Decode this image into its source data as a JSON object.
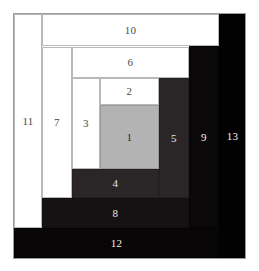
{
  "diagram": {
    "canvas": {
      "width": 259,
      "height": 271,
      "background": "#ffffff"
    },
    "palette": {
      "white": "#ffffff",
      "gray": "#b3b3b3",
      "dark": "#2a2527",
      "darker": "#161214",
      "black": "#070506",
      "outline": "#9b9b9b",
      "label_light": "#f0f0f0",
      "label_dark": "#4a4a4a"
    },
    "regions": [
      {
        "id": 1,
        "label": "1",
        "tone": "gray",
        "x": 100,
        "y": 105,
        "w": 59,
        "h": 64,
        "label_x": 129,
        "label_y": 137
      },
      {
        "id": 2,
        "label": "2",
        "tone": "white",
        "x": 100,
        "y": 78,
        "w": 59,
        "h": 27,
        "label_x": 129,
        "label_y": 91
      },
      {
        "id": 3,
        "label": "3",
        "tone": "white",
        "x": 72,
        "y": 78,
        "w": 28,
        "h": 91,
        "label_x": 86,
        "label_y": 137
      },
      {
        "id": 4,
        "label": "4",
        "tone": "dark",
        "x": 72,
        "y": 169,
        "w": 87,
        "h": 29,
        "label_x": 129,
        "label_y": 183
      },
      {
        "id": 5,
        "label": "5",
        "tone": "dark",
        "x": 159,
        "y": 78,
        "w": 30,
        "h": 120,
        "label_x": 174,
        "label_y": 137
      },
      {
        "id": 6,
        "label": "6",
        "tone": "white",
        "x": 72,
        "y": 47,
        "w": 117,
        "h": 31,
        "label_x": 129,
        "label_y": 62
      },
      {
        "id": 7,
        "label": "7",
        "tone": "white",
        "x": 42,
        "y": 47,
        "w": 30,
        "h": 151,
        "label_x": 57,
        "label_y": 137
      },
      {
        "id": 8,
        "label": "8",
        "tone": "darker",
        "x": 42,
        "y": 198,
        "w": 147,
        "h": 30,
        "label_x": 129,
        "label_y": 213
      },
      {
        "id": 9,
        "label": "9",
        "tone": "black2",
        "x": 189,
        "y": 46,
        "w": 30,
        "h": 182,
        "label_x": 204,
        "label_y": 137
      },
      {
        "id": 10,
        "label": "10",
        "tone": "white",
        "x": 42,
        "y": 14,
        "w": 177,
        "h": 32,
        "label_x": 129,
        "label_y": 30
      },
      {
        "id": 11,
        "label": "11",
        "tone": "white",
        "x": 14,
        "y": 14,
        "w": 28,
        "h": 214,
        "label_x": 27,
        "label_y": 137
      },
      {
        "id": 12,
        "label": "12",
        "tone": "black",
        "x": 14,
        "y": 228,
        "w": 205,
        "h": 30,
        "label_x": 129,
        "label_y": 243
      },
      {
        "id": 13,
        "label": "13",
        "tone": "black3",
        "x": 219,
        "y": 14,
        "w": 27,
        "h": 244,
        "label_x": 232,
        "label_y": 137
      }
    ]
  }
}
